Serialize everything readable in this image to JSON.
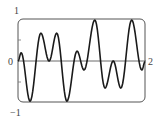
{
  "chart_data": {
    "type": "line",
    "title": "",
    "xlabel": "",
    "ylabel": "",
    "xlim": [
      0,
      2
    ],
    "ylim": [
      -1,
      1
    ],
    "grid": false,
    "legend": null,
    "tick_labels": {
      "y_top": "1",
      "y_zero": "0",
      "y_bottom": "−1",
      "x_right": "2"
    },
    "series": [
      {
        "name": "f(x)",
        "x": [
          0,
          0.05,
          0.19,
          0.36,
          0.49,
          0.61,
          0.77,
          0.93,
          1.04,
          1.21,
          1.37,
          1.5,
          1.62,
          1.79,
          1.95,
          2.0
        ],
        "values": [
          0,
          0.2,
          -0.98,
          0.68,
          0.0,
          0.68,
          -0.98,
          0.24,
          -0.22,
          1.0,
          -0.66,
          0.0,
          -0.66,
          1.0,
          -0.22,
          -0.02
        ]
      }
    ]
  },
  "colors": {
    "curve": "#1a1a1a",
    "frame": "#555555",
    "axis": "#444444"
  }
}
